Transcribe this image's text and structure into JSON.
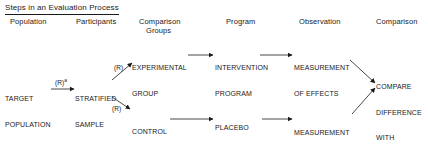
{
  "title": "Steps in an Evaluation Process",
  "headers": {
    "population": "Population",
    "participants": "Participants",
    "comparison_groups_1": "Comparison",
    "comparison_groups_2": "Groups",
    "program": "Program",
    "observation": "Observation",
    "comparison": "Comparison"
  },
  "nodes": {
    "target_population": [
      "TARGET",
      "POPULATION"
    ],
    "stratified_sample": [
      "STRATIFIED",
      "SAMPLE"
    ],
    "experimental_group": [
      "EXPERIMENTAL",
      "GROUP"
    ],
    "control_group": [
      "CONTROL",
      "GROUP"
    ],
    "intervention_program": [
      "INTERVENTION",
      "PROGRAM"
    ],
    "placebo": [
      "PLACEBO",
      "OR CURRENT",
      "PROCEDURES"
    ],
    "measurement_top": [
      "MEASUREMENT",
      "OF EFFECTS"
    ],
    "measurement_bottom": [
      "MEASUREMENT",
      "OF EFFECTS"
    ],
    "compare": [
      "COMPARE",
      "DIFFERENCE",
      "WITH",
      "STATISTICAL",
      "TESTS"
    ]
  },
  "edge_labels": {
    "target_to_sample": "(R)",
    "target_to_sample_sup": "a",
    "sample_to_experimental": "(R)",
    "sample_to_control": "(R)"
  }
}
